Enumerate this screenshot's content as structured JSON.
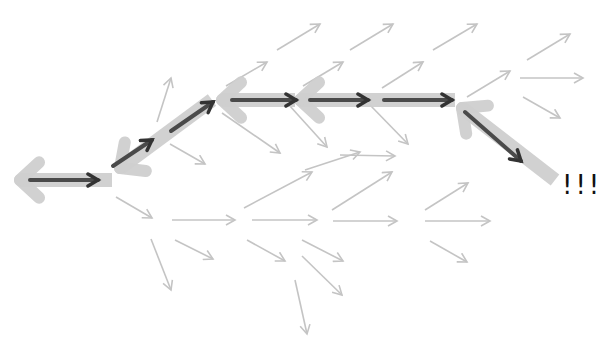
{
  "diagram": {
    "colors": {
      "background": "#ffffff",
      "faint_arrow": "#c4c4c4",
      "path_arrow": "#4a4a4a",
      "backtrack_arrow": "#cfcfcf",
      "label": "#111111"
    },
    "faint_arrows": [
      {
        "x1": 157,
        "y1": 122,
        "x2": 171,
        "y2": 78
      },
      {
        "x1": 226,
        "y1": 86,
        "x2": 267,
        "y2": 62
      },
      {
        "x1": 277,
        "y1": 50,
        "x2": 320,
        "y2": 24
      },
      {
        "x1": 350,
        "y1": 50,
        "x2": 393,
        "y2": 24
      },
      {
        "x1": 433,
        "y1": 50,
        "x2": 477,
        "y2": 24
      },
      {
        "x1": 527,
        "y1": 60,
        "x2": 570,
        "y2": 34
      },
      {
        "x1": 303,
        "y1": 86,
        "x2": 343,
        "y2": 62
      },
      {
        "x1": 382,
        "y1": 88,
        "x2": 423,
        "y2": 62
      },
      {
        "x1": 467,
        "y1": 97,
        "x2": 510,
        "y2": 71
      },
      {
        "x1": 520,
        "y1": 78,
        "x2": 583,
        "y2": 78
      },
      {
        "x1": 523,
        "y1": 97,
        "x2": 560,
        "y2": 118
      },
      {
        "x1": 170,
        "y1": 144,
        "x2": 205,
        "y2": 164
      },
      {
        "x1": 222,
        "y1": 113,
        "x2": 280,
        "y2": 153
      },
      {
        "x1": 289,
        "y1": 105,
        "x2": 327,
        "y2": 147
      },
      {
        "x1": 370,
        "y1": 105,
        "x2": 408,
        "y2": 144
      },
      {
        "x1": 340,
        "y1": 155,
        "x2": 395,
        "y2": 156
      },
      {
        "x1": 305,
        "y1": 170,
        "x2": 360,
        "y2": 152
      },
      {
        "x1": 116,
        "y1": 197,
        "x2": 152,
        "y2": 218
      },
      {
        "x1": 172,
        "y1": 220,
        "x2": 235,
        "y2": 220
      },
      {
        "x1": 244,
        "y1": 208,
        "x2": 312,
        "y2": 172
      },
      {
        "x1": 252,
        "y1": 220,
        "x2": 317,
        "y2": 220
      },
      {
        "x1": 332,
        "y1": 210,
        "x2": 392,
        "y2": 172
      },
      {
        "x1": 333,
        "y1": 221,
        "x2": 397,
        "y2": 221
      },
      {
        "x1": 425,
        "y1": 210,
        "x2": 468,
        "y2": 183
      },
      {
        "x1": 425,
        "y1": 221,
        "x2": 490,
        "y2": 221
      },
      {
        "x1": 430,
        "y1": 241,
        "x2": 467,
        "y2": 262
      },
      {
        "x1": 175,
        "y1": 240,
        "x2": 213,
        "y2": 259
      },
      {
        "x1": 247,
        "y1": 240,
        "x2": 285,
        "y2": 261
      },
      {
        "x1": 151,
        "y1": 239,
        "x2": 171,
        "y2": 290
      },
      {
        "x1": 302,
        "y1": 240,
        "x2": 343,
        "y2": 261
      },
      {
        "x1": 302,
        "y1": 256,
        "x2": 342,
        "y2": 295
      },
      {
        "x1": 295,
        "y1": 280,
        "x2": 307,
        "y2": 334
      }
    ],
    "backtrack_arrows": [
      {
        "x1": 112,
        "y1": 180,
        "x2": 20,
        "y2": 180
      },
      {
        "x1": 212,
        "y1": 100,
        "x2": 120,
        "y2": 168
      },
      {
        "x1": 295,
        "y1": 100,
        "x2": 222,
        "y2": 100
      },
      {
        "x1": 455,
        "y1": 100,
        "x2": 300,
        "y2": 100
      },
      {
        "x1": 555,
        "y1": 180,
        "x2": 462,
        "y2": 108
      }
    ],
    "path_arrows": [
      {
        "x1": 30,
        "y1": 180,
        "x2": 98,
        "y2": 180
      },
      {
        "x1": 113,
        "y1": 166,
        "x2": 152,
        "y2": 140
      },
      {
        "x1": 171,
        "y1": 131,
        "x2": 213,
        "y2": 102
      },
      {
        "x1": 232,
        "y1": 100,
        "x2": 296,
        "y2": 100
      },
      {
        "x1": 310,
        "y1": 100,
        "x2": 368,
        "y2": 100
      },
      {
        "x1": 384,
        "y1": 100,
        "x2": 452,
        "y2": 100
      },
      {
        "x1": 465,
        "y1": 112,
        "x2": 521,
        "y2": 161
      }
    ],
    "label": {
      "text": "!!!",
      "x": 562,
      "y": 170
    }
  }
}
